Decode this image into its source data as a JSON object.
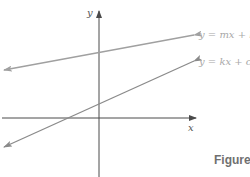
{
  "figure": {
    "caption": "Figure",
    "axes": {
      "x_label": "x",
      "y_label": "y"
    },
    "lines": [
      {
        "id": "line-1",
        "equation": "y = mx + b",
        "color": "#a0a0a0"
      },
      {
        "id": "line-2",
        "equation": "y = kx + c",
        "color": "#8a8a8a"
      }
    ],
    "colors": {
      "axis": "#4a4a4a",
      "background": "#ffffff"
    }
  }
}
